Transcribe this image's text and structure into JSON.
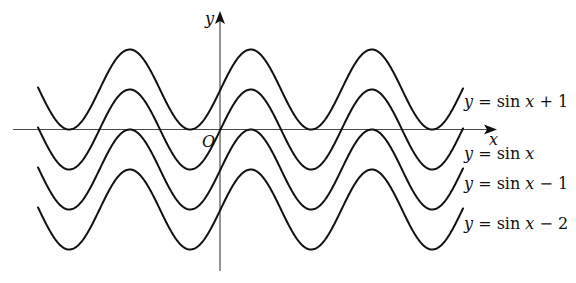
{
  "figure": {
    "axes": {
      "x_label": "x",
      "y_label": "y",
      "origin_label": "O"
    },
    "curves": [
      {
        "name": "sin-x-plus-1",
        "offset": 1,
        "label_y": "y",
        "label_eq": " = sin ",
        "label_x": "x",
        "label_tail": " + 1"
      },
      {
        "name": "sin-x",
        "offset": 0,
        "label_y": "y",
        "label_eq": " = sin ",
        "label_x": "x",
        "label_tail": ""
      },
      {
        "name": "sin-x-minus-1",
        "offset": -1,
        "label_y": "y",
        "label_eq": " = sin ",
        "label_x": "x",
        "label_tail": " − 1"
      },
      {
        "name": "sin-x-minus-2",
        "offset": -2,
        "label_y": "y",
        "label_eq": " = sin ",
        "label_x": "x",
        "label_tail": " − 2"
      }
    ]
  },
  "chart_data": {
    "type": "line",
    "title": "",
    "xlabel": "x",
    "ylabel": "y",
    "grid": false,
    "legend": "inline labels at right end of curves",
    "series": [
      {
        "name": "y = sin x + 1",
        "function": "sin(x) + 1",
        "range": [
          0,
          2
        ]
      },
      {
        "name": "y = sin x",
        "function": "sin(x)",
        "range": [
          -1,
          1
        ]
      },
      {
        "name": "y = sin x − 1",
        "function": "sin(x) - 1",
        "range": [
          -2,
          0
        ]
      },
      {
        "name": "y = sin x − 2",
        "function": "sin(x) - 2",
        "range": [
          -3,
          -1
        ]
      }
    ],
    "x_range_approx": [
      -9.3,
      12.8
    ],
    "annotations": [
      "O"
    ]
  }
}
